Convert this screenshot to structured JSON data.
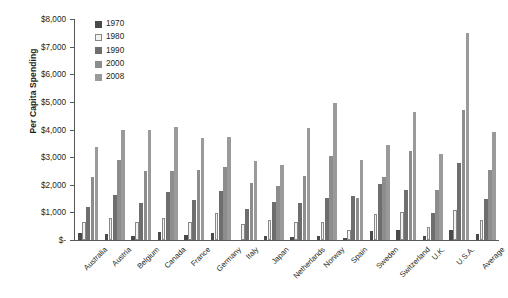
{
  "chart_data": {
    "type": "bar",
    "title": "",
    "xlabel": "",
    "ylabel": "Per Capita Spending",
    "ylim": [
      0,
      8000
    ],
    "ytick_values": [
      0,
      1000,
      2000,
      3000,
      4000,
      5000,
      6000,
      7000,
      8000
    ],
    "ytick_labels": [
      "$-",
      "$1,000",
      "$2,000",
      "$3,000",
      "$4,000",
      "$5,000",
      "$6,000",
      "$7,000",
      "$8,000"
    ],
    "grid": false,
    "legend_position": "top-left-inside",
    "categories": [
      "Australia",
      "Austria",
      "Belgium",
      "Canada",
      "France",
      "Germany",
      "Italy",
      "Japan",
      "Netherlands",
      "Norway",
      "Spain",
      "Sweden",
      "Switzerland",
      "U.K.",
      "U.S.A.",
      "Average"
    ],
    "series": [
      {
        "name": "1970",
        "color": "#4a4a4a",
        "values": [
          250,
          200,
          150,
          290,
          190,
          270,
          0,
          150,
          100,
          140,
          90,
          310,
          350,
          160,
          360,
          210
        ]
      },
      {
        "name": "1980",
        "color": "#f2f2f2",
        "values": [
          660,
          810,
          670,
          790,
          660,
          960,
          580,
          740,
          660,
          650,
          370,
          930,
          1010,
          460,
          1090,
          710
        ]
      },
      {
        "name": "1990",
        "color": "#6e6e6e",
        "values": [
          1210,
          1630,
          1350,
          1740,
          1450,
          1770,
          1130,
          1390,
          1350,
          1530,
          1600,
          2030,
          1810,
          960,
          2790,
          1500
        ]
      },
      {
        "name": "2000",
        "color": "#8d8d8d",
        "values": [
          2270,
          2880,
          2490,
          2510,
          2540,
          2660,
          2070,
          1960,
          2330,
          3040,
          1520,
          2270,
          3220,
          1800,
          4700,
          2520
        ]
      },
      {
        "name": "2008",
        "color": "#9a9a9a",
        "values": [
          3350,
          3970,
          4000,
          4090,
          3700,
          3740,
          2870,
          2730,
          4060,
          4960,
          2900,
          3440,
          4620,
          3120,
          7500,
          3920
        ]
      }
    ]
  }
}
